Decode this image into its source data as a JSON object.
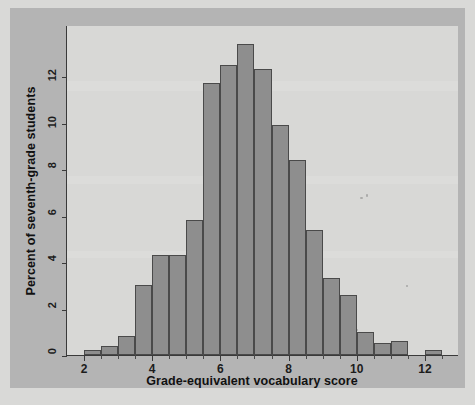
{
  "chart_data": {
    "type": "bar",
    "title": "",
    "xlabel": "Grade-equivalent vocabulary score",
    "ylabel": "Percent of seventh-grade students",
    "xlim": [
      1.5,
      13.0
    ],
    "ylim": [
      0,
      14.2
    ],
    "xticks": [
      2,
      4,
      6,
      8,
      10,
      12
    ],
    "yticks": [
      0,
      2,
      4,
      6,
      8,
      10,
      12
    ],
    "grid": false,
    "legend": null,
    "bin_width": 0.5,
    "bin_starts": [
      2.0,
      2.5,
      3.0,
      3.5,
      4.0,
      4.5,
      5.0,
      5.5,
      6.0,
      6.5,
      7.0,
      7.5,
      8.0,
      8.5,
      9.0,
      9.5,
      10.0,
      10.5,
      11.0,
      12.0
    ],
    "categories": [
      "2.0-2.5",
      "2.5-3.0",
      "3.0-3.5",
      "3.5-4.0",
      "4.0-4.5",
      "4.5-5.0",
      "5.0-5.5",
      "5.5-6.0",
      "6.0-6.5",
      "6.5-7.0",
      "7.0-7.5",
      "7.5-8.0",
      "8.0-8.5",
      "8.5-9.0",
      "9.0-9.5",
      "9.5-10.0",
      "10.0-10.5",
      "10.5-11.0",
      "11.0-11.5",
      "12.0-12.5"
    ],
    "values": [
      0.2,
      0.4,
      0.8,
      3.0,
      4.3,
      4.3,
      5.8,
      11.7,
      12.5,
      13.4,
      12.3,
      9.9,
      8.4,
      5.4,
      3.3,
      2.6,
      1.0,
      0.5,
      0.6,
      0.2
    ],
    "bar_color": "#8e8e8e",
    "bar_edge_color": "#4a4a4a",
    "plot_background": "#d8d8d6",
    "figure_background": "#b4b4b4"
  },
  "axes": {
    "y_title": "Percent of seventh-grade students",
    "x_title": "Grade-equivalent vocabulary score",
    "y_tick_labels": [
      "0",
      "2",
      "4",
      "6",
      "8",
      "10",
      "12"
    ],
    "x_tick_labels": [
      "2",
      "4",
      "6",
      "8",
      "10",
      "12"
    ]
  }
}
